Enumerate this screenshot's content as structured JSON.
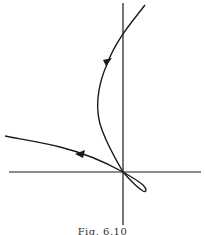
{
  "figure": {
    "caption": "Fig. 6.10",
    "colors": {
      "stroke": "#1a1a1a",
      "background": "#ffffff"
    },
    "axes": {
      "origin": [
        123,
        172
      ],
      "x_axis": {
        "from": [
          9,
          172
        ],
        "to": [
          201,
          172
        ]
      },
      "y_axis": {
        "from": [
          123,
          3
        ],
        "to": [
          123,
          225
        ]
      }
    },
    "curves": [
      {
        "name": "upper-trajectory",
        "path": "M145,5 C132,22 116,40 108,62 C96,88 95,112 102,130 C108,146 116,160 123,172",
        "arrow": {
          "at": [
            108,
            60
          ],
          "direction": "down-left"
        }
      },
      {
        "name": "left-trajectory",
        "path": "M123,172 C105,162 80,152 60,147 C40,142 20,139 5,136",
        "arrow": {
          "at": [
            80,
            155
          ],
          "direction": "left"
        }
      },
      {
        "name": "origin-loop",
        "path": "M123,172 C130,180 138,188 143,191 C147,193 147,189 143,185 C137,180 130,176 123,172"
      }
    ],
    "arrows": [
      {
        "name": "arrow-upper",
        "points": "103,60 112,58 106,66"
      },
      {
        "name": "arrow-left",
        "points": "75,154 85,150 83,158"
      }
    ]
  }
}
